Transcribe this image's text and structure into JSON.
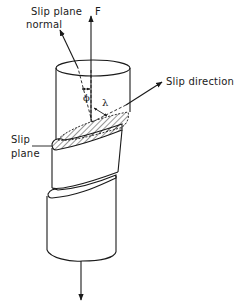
{
  "diagram": {
    "type": "schematic",
    "labels": {
      "slip_plane_normal_line1": "Slip plane",
      "slip_plane_normal_line2": "normal",
      "force": "F",
      "slip_direction": "Slip direction",
      "slip_plane_line1": "Slip",
      "slip_plane_line2": "plane",
      "phi": "ϕ",
      "lambda": "λ"
    },
    "arrows": [
      {
        "name": "applied-force-up",
        "label": "F",
        "direction": "up"
      },
      {
        "name": "slip-plane-normal",
        "label": "Slip plane normal"
      },
      {
        "name": "slip-direction",
        "label": "Slip direction"
      },
      {
        "name": "applied-force-down",
        "label": "",
        "direction": "down"
      }
    ],
    "angles": [
      {
        "symbol": "ϕ",
        "between": [
          "F",
          "Slip plane normal"
        ]
      },
      {
        "symbol": "λ",
        "between": [
          "F",
          "Slip direction"
        ]
      }
    ],
    "colors": {
      "line": "#1a1a1a",
      "background": "#ffffff"
    }
  }
}
